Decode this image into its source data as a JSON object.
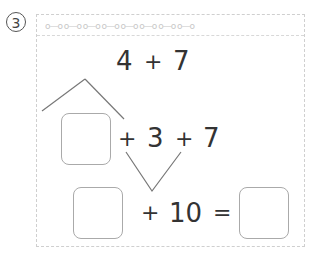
{
  "problem": {
    "number": "3",
    "number_glyph": "③"
  },
  "header": {
    "decoration": "o—o o—o o—o o—o o—o o—o o—o o—o"
  },
  "expression": {
    "row1": {
      "a": "4",
      "op": "+",
      "b": "7"
    },
    "row2": {
      "op1": "+",
      "a": "3",
      "op2": "+",
      "b": "7"
    },
    "row3": {
      "op": "+",
      "a": "10",
      "eq": "="
    }
  },
  "answer_boxes": [
    "",
    "",
    ""
  ]
}
